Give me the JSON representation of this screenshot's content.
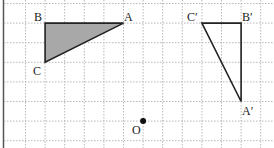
{
  "diagram": {
    "grid": {
      "cols": 13,
      "rows": 7,
      "cell": 19.6,
      "origin_x": 25.5,
      "origin_y": 3.5,
      "line_color": "#b8b8b8"
    },
    "original_triangle": {
      "fill": "#a8a8a8",
      "vertices": [
        {
          "label": "A",
          "gx": 5,
          "gy": 1
        },
        {
          "label": "B",
          "gx": 1,
          "gy": 1
        },
        {
          "label": "C",
          "gx": 1,
          "gy": 3
        }
      ]
    },
    "image_triangle": {
      "fill": "none",
      "vertices": [
        {
          "label": "A′",
          "gx": 11,
          "gy": 5
        },
        {
          "label": "B′",
          "gx": 11,
          "gy": 1
        },
        {
          "label": "C′",
          "gx": 9,
          "gy": 1
        }
      ]
    },
    "center": {
      "label": "O",
      "gx": 6,
      "gy": 6
    },
    "labels": {
      "A": "A",
      "B": "B",
      "C": "C",
      "A_prime": "A′",
      "B_prime": "B′",
      "C_prime": "C′",
      "O": "O"
    }
  }
}
